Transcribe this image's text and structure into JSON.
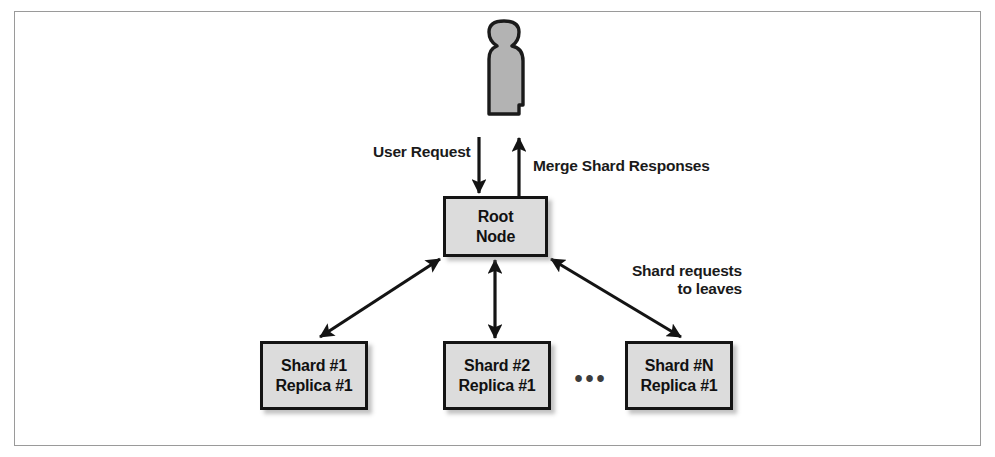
{
  "diagram": {
    "colors": {
      "box_fill": "#dcdcdc",
      "box_border": "#141414",
      "person_fill": "#b3b3b3",
      "person_outline": "#1a1a1a",
      "arrow": "#141414",
      "frame_border": "#9a9a9a",
      "text": "#1a1a1a"
    },
    "actor": {
      "name": "user-person",
      "shape": "person-silhouette"
    },
    "nodes": {
      "root": {
        "line1": "Root",
        "line2": "Node"
      },
      "shards": [
        {
          "line1": "Shard #1",
          "line2": "Replica #1"
        },
        {
          "line1": "Shard #2",
          "line2": "Replica #1"
        },
        {
          "line1": "Shard #N",
          "line2": "Replica #1"
        }
      ],
      "ellipsis": "•••"
    },
    "labels": {
      "user_request": "User Request",
      "merge_shard_responses": "Merge Shard Responses",
      "shard_requests_line1": "Shard requests",
      "shard_requests_line2": "to leaves"
    },
    "edges": [
      {
        "name": "user-to-root",
        "from": "user-person",
        "to": "root",
        "direction": "down",
        "label": "User Request"
      },
      {
        "name": "root-to-user",
        "from": "root",
        "to": "user-person",
        "direction": "up",
        "label": "Merge Shard Responses"
      },
      {
        "name": "root-to-shard-1",
        "from": "root",
        "to": "Shard #1",
        "direction": "bidirectional",
        "label": ""
      },
      {
        "name": "root-to-shard-2",
        "from": "root",
        "to": "Shard #2",
        "direction": "bidirectional",
        "label": ""
      },
      {
        "name": "root-to-shard-n",
        "from": "root",
        "to": "Shard #N",
        "direction": "bidirectional",
        "label": "Shard requests to leaves"
      }
    ]
  }
}
